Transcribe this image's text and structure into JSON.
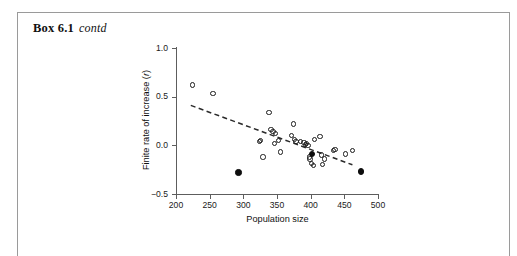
{
  "box": {
    "label": "Box 6.1",
    "continued": "contd"
  },
  "chart_data": {
    "type": "scatter",
    "title": "",
    "xlabel": "Population size",
    "ylabel": "Finite rate of increase (r)",
    "xlim": [
      200,
      500
    ],
    "ylim": [
      -0.5,
      1.0
    ],
    "xticks": [
      200,
      250,
      300,
      350,
      400,
      450,
      500
    ],
    "xticklabels": [
      "200",
      "250",
      "300",
      "350",
      "400",
      "450",
      "500"
    ],
    "yticks": [
      -0.5,
      0.0,
      0.5,
      1.0
    ],
    "yticklabels": [
      "−0.5",
      "0.0",
      "0.5",
      "1.0"
    ],
    "grid": false,
    "legend": false,
    "marker_colors": {
      "open": "#1b1b1b",
      "filled": "#0d0d0d",
      "trendline": "#2a2a2a"
    },
    "series": [
      {
        "name": "populations (open circles)",
        "marker": "open-circle",
        "points": [
          [
            224,
            0.62
          ],
          [
            255,
            0.53
          ],
          [
            338,
            0.34
          ],
          [
            325,
            0.05
          ],
          [
            324,
            0.04
          ],
          [
            329,
            -0.12
          ],
          [
            341,
            0.16
          ],
          [
            344,
            0.14
          ],
          [
            348,
            0.12
          ],
          [
            346,
            0.02
          ],
          [
            352,
            0.05
          ],
          [
            355,
            -0.07
          ],
          [
            374,
            0.22
          ],
          [
            372,
            0.1
          ],
          [
            376,
            0.06
          ],
          [
            378,
            0.04
          ],
          [
            385,
            0.04
          ],
          [
            390,
            0.03
          ],
          [
            392,
            0.01
          ],
          [
            394,
            0.02
          ],
          [
            396,
            0.0
          ],
          [
            398,
            -0.12
          ],
          [
            399,
            -0.14
          ],
          [
            401,
            -0.19
          ],
          [
            404,
            -0.21
          ],
          [
            406,
            0.06
          ],
          [
            414,
            0.09
          ],
          [
            416,
            -0.1
          ],
          [
            418,
            -0.2
          ],
          [
            421,
            -0.14
          ],
          [
            434,
            -0.05
          ],
          [
            436,
            -0.04
          ],
          [
            452,
            -0.09
          ],
          [
            462,
            -0.05
          ]
        ]
      },
      {
        "name": "highlighted populations (filled circles)",
        "marker": "filled-circle",
        "points": [
          [
            293,
            -0.28
          ],
          [
            402,
            -0.09
          ],
          [
            475,
            -0.27
          ]
        ]
      }
    ],
    "trendline": {
      "style": "dashed",
      "x": [
        222,
        462
      ],
      "y": [
        0.41,
        -0.2
      ]
    }
  }
}
